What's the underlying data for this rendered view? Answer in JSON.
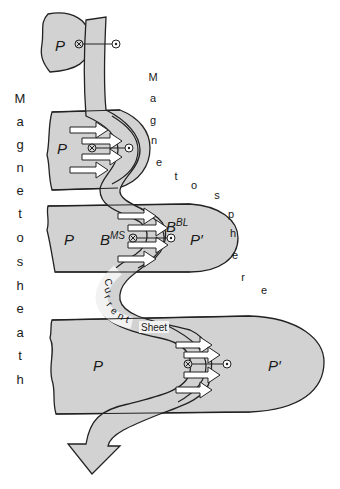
{
  "colors": {
    "fill": "#d2d2d2",
    "stroke": "#222222",
    "sheet_fill": "#e6e6e6",
    "arrow_fill": "#ffffff"
  },
  "labels": {
    "left_vertical_word": "Magnetosheath",
    "left_letters": [
      "M",
      "a",
      "g",
      "n",
      "e",
      "t",
      "o",
      "s",
      "h",
      "e",
      "a",
      "t",
      "h"
    ],
    "right_diagonal_word": "Magnetosphere",
    "right_letters": [
      "M",
      "a",
      "g",
      "n",
      "e",
      "t",
      "o",
      "s",
      "p",
      "h",
      "e",
      "r",
      "e"
    ],
    "current_letters": [
      "C",
      "u",
      "r",
      "r",
      "e",
      "n",
      "t"
    ],
    "sheet": "Sheet",
    "plasma_top": "P",
    "plasma_2": "P",
    "plasma_3": "P",
    "plasma_3_prime": "P′",
    "plasma_4": "P",
    "plasma_4_prime": "P′",
    "b_ms_base": "B",
    "b_ms_sup": "MS",
    "b_bl_base": "B",
    "b_bl_sup": "BL"
  },
  "symbols": {
    "field_into_page": "⊗",
    "field_out_of_page": "⊙"
  }
}
